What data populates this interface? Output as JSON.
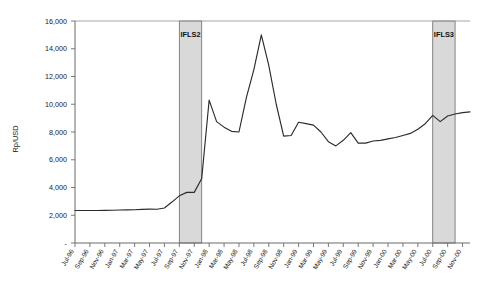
{
  "chart_data": {
    "type": "line",
    "title": "",
    "xlabel": "",
    "ylabel": "Rp/USD",
    "ylim": [
      0,
      16000
    ],
    "yticks": [
      0,
      2000,
      4000,
      6000,
      8000,
      10000,
      12000,
      14000,
      16000
    ],
    "ytick_labels": [
      "-",
      "2,000",
      "4,000",
      "6,000",
      "8,000",
      "10,000",
      "12,000",
      "14,000",
      "16,000"
    ],
    "grid": false,
    "legend": "none",
    "categories": [
      "Jul-96",
      "Aug-96",
      "Sep-96",
      "Oct-96",
      "Nov-96",
      "Dec-96",
      "Jan-97",
      "Feb-97",
      "Mar-97",
      "Apr-97",
      "May-97",
      "Jun-97",
      "Jul-97",
      "Aug-97",
      "Sep-97",
      "Oct-97",
      "Nov-97",
      "Dec-97",
      "Jan-98",
      "Feb-98",
      "Mar-98",
      "Apr-98",
      "May-98",
      "Jun-98",
      "Jul-98",
      "Aug-98",
      "Sep-98",
      "Oct-98",
      "Nov-98",
      "Dec-98",
      "Jan-99",
      "Feb-99",
      "Mar-99",
      "Apr-99",
      "May-99",
      "Jun-99",
      "Jul-99",
      "Aug-99",
      "Sep-99",
      "Oct-99",
      "Nov-99",
      "Dec-99",
      "Jan-00",
      "Feb-00",
      "Mar-00",
      "Apr-00",
      "May-00",
      "Jun-00",
      "Jul-00",
      "Aug-00",
      "Sep-00",
      "Oct-00",
      "Nov-00",
      "Dec-00"
    ],
    "xtick_labels": [
      "Jul-96",
      "Sep-96",
      "Nov-96",
      "Jan-97",
      "Mar-97",
      "May-97",
      "Jul-97",
      "Sep-97",
      "Nov-97",
      "Jan-98",
      "Mar-98",
      "May-98",
      "Jul-98",
      "Sep-98",
      "Nov-98",
      "Jan-99",
      "Mar-99",
      "May-99",
      "Jul-99",
      "Sep-99",
      "Nov-99",
      "Jan-00",
      "Mar-00",
      "May-00",
      "Jul-00",
      "Sep-00",
      "Nov-00"
    ],
    "values": [
      2340,
      2340,
      2340,
      2345,
      2350,
      2360,
      2375,
      2390,
      2400,
      2420,
      2440,
      2430,
      2520,
      2950,
      3400,
      3650,
      3650,
      4650,
      10300,
      8750,
      8350,
      8050,
      8000,
      10500,
      12500,
      15000,
      12800,
      10000,
      7700,
      7750,
      8700,
      8600,
      8500,
      8000,
      7300,
      7000,
      7400,
      7950,
      7200,
      7200,
      7350,
      7400,
      7500,
      7600,
      7750,
      7900,
      8200,
      8600,
      9200,
      8750,
      9150,
      9300,
      9400,
      9450
    ],
    "bands": [
      {
        "label": "IFLS2",
        "start": "Sep-97",
        "end": "Dec-97",
        "color": "#d9d9d9"
      },
      {
        "label": "IFLS3",
        "start": "Jul-00",
        "end": "Oct-00",
        "color": "#d9d9d9"
      }
    ],
    "line_color": "#2b2b2b",
    "axis_color": "#6b6b6b"
  }
}
